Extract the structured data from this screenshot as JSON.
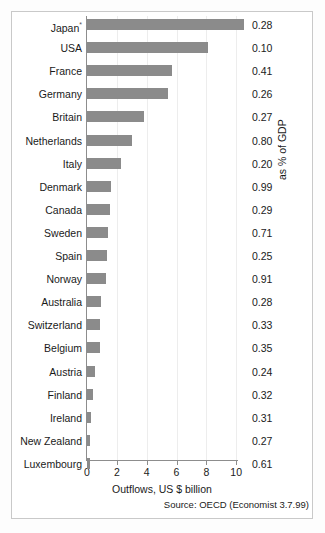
{
  "chart_data": {
    "type": "bar",
    "orientation": "horizontal",
    "title": "",
    "xlabel": "Outflows, US $ billion",
    "ylabel": "",
    "right_axis_label": "as % of GDP",
    "source": "Source: OECD (Economist 3.7.99)",
    "xlim": [
      0,
      11
    ],
    "xticks": [
      0,
      2,
      4,
      6,
      8,
      10
    ],
    "xtick_labels": [
      "0",
      "2",
      "4",
      "6",
      "8",
      "10"
    ],
    "grid": "vertical-faint",
    "legend": "none",
    "bar_color": "#8b8b8b",
    "categories": [
      "Japan",
      "USA",
      "France",
      "Germany",
      "Britain",
      "Netherlands",
      "Italy",
      "Denmark",
      "Canada",
      "Sweden",
      "Spain",
      "Norway",
      "Australia",
      "Switzerland",
      "Belgium",
      "Austria",
      "Finland",
      "Ireland",
      "New Zealand",
      "Luxembourg"
    ],
    "category_markers": {
      "Japan": "*"
    },
    "values": [
      10.5,
      8.1,
      5.7,
      5.4,
      3.8,
      3.0,
      2.3,
      1.6,
      1.55,
      1.4,
      1.35,
      1.3,
      0.95,
      0.9,
      0.88,
      0.55,
      0.4,
      0.27,
      0.2,
      0.2
    ],
    "series": [
      {
        "name": "Outflows, US $ billion",
        "values": [
          10.5,
          8.1,
          5.7,
          5.4,
          3.8,
          3.0,
          2.3,
          1.6,
          1.55,
          1.4,
          1.35,
          1.3,
          0.95,
          0.9,
          0.88,
          0.55,
          0.4,
          0.27,
          0.2,
          0.2
        ]
      },
      {
        "name": "as % of GDP",
        "display": "text-column",
        "values": [
          "0.28",
          "0.10",
          "0.41",
          "0.26",
          "0.27",
          "0.80",
          "0.20",
          "0.99",
          "0.29",
          "0.71",
          "0.25",
          "0.91",
          "0.28",
          "0.33",
          "0.35",
          "0.24",
          "0.32",
          "0.31",
          "0.27",
          "0.61"
        ]
      }
    ]
  }
}
